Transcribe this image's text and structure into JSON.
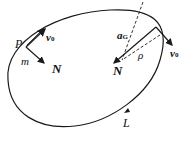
{
  "diagram": {
    "type": "closed-curve-motion",
    "stroke_color": "#1a1a1a",
    "labels": {
      "point_p": "P",
      "mass_m": "m",
      "velocity_left": "v",
      "velocity_left_sub": "0",
      "normal_left": "N",
      "accel": "a",
      "accel_sub": "G",
      "radius": "ρ",
      "normal_right": "N",
      "velocity_right": "v",
      "velocity_right_sub": "0",
      "curve_label": "L"
    }
  }
}
